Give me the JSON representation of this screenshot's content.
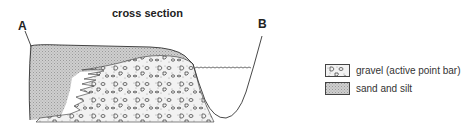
{
  "title": "cross section",
  "labels": {
    "start": "A",
    "end": "B"
  },
  "legend": [
    {
      "id": "gravel",
      "label": "gravel (active point bar)",
      "pattern": "gravel-clasts"
    },
    {
      "id": "sand",
      "label": "sand and silt",
      "pattern": "stipple-gray"
    }
  ],
  "colors": {
    "line": "#333333",
    "sand_fill": "#c4c4c4",
    "gravel_fill": "#ececec",
    "text": "#222222"
  }
}
